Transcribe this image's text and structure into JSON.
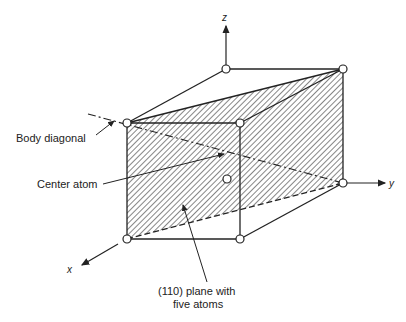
{
  "diagram": {
    "axes": {
      "x": "x",
      "y": "y",
      "z": "z"
    },
    "labels": {
      "body_diagonal": "Body diagonal",
      "center_atom": "Center atom",
      "plane_line1": "(110) plane with",
      "plane_line2": "five atoms"
    },
    "atoms": [
      {
        "name": "front-top-left",
        "x": 127,
        "y": 123
      },
      {
        "name": "front-top-right",
        "x": 240,
        "y": 123
      },
      {
        "name": "back-top-left",
        "x": 226,
        "y": 69
      },
      {
        "name": "back-top-right",
        "x": 343,
        "y": 69
      },
      {
        "name": "front-bottom-left",
        "x": 127,
        "y": 239
      },
      {
        "name": "front-bottom-right",
        "x": 240,
        "y": 239
      },
      {
        "name": "back-bottom-right",
        "x": 343,
        "y": 183
      },
      {
        "name": "center",
        "x": 227,
        "y": 179
      }
    ],
    "colors": {
      "line": "#222222",
      "atom_fill": "#ffffff"
    }
  }
}
